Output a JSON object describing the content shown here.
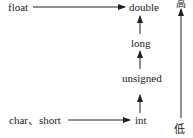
{
  "diagram": {
    "title": "",
    "nodes": {
      "float": "float",
      "double": "double",
      "long": "long",
      "unsigned": "unsigned",
      "char_short": "char、short",
      "int": "int"
    },
    "scale": {
      "high": "高",
      "low": "低"
    },
    "edges": [
      {
        "from": "float",
        "to": "double"
      },
      {
        "from": "char_short",
        "to": "int"
      },
      {
        "from": "int",
        "to": "unsigned"
      },
      {
        "from": "unsigned",
        "to": "long"
      },
      {
        "from": "long",
        "to": "double"
      }
    ],
    "colors": {
      "line": "#222222",
      "text": "#222222"
    }
  }
}
